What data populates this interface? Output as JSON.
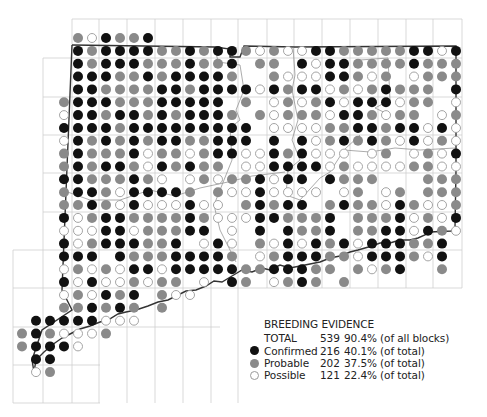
{
  "colors": {
    "confirmed": "#111111",
    "probable": "#8a8a8a",
    "possible_fill": "#ffffff",
    "possible_stroke": "#9a9a9a",
    "grid": "#cfcfcf",
    "border": "#333333"
  },
  "legend": {
    "title": "BREEDING EVIDENCE",
    "total": {
      "label": "TOTAL",
      "count": "539",
      "pct": "90.4% (of all blocks)"
    },
    "items": [
      {
        "key": "confirmed",
        "label": "Confirmed",
        "count": "216",
        "pct": "40.1% (of total)"
      },
      {
        "key": "probable",
        "label": "Probable",
        "count": "202",
        "pct": "37.5% (of total)"
      },
      {
        "key": "possible",
        "label": "Possible",
        "count": "121",
        "pct": "22.4% (of total)"
      }
    ]
  },
  "map": {
    "dot_grid": {
      "x0": 22,
      "dx": 14,
      "y0": 38,
      "dy": 12.85,
      "r": 5,
      "codes": {
        "B": "confirmed",
        "G": "probable",
        "O": "possible"
      },
      "rows": [
        "....GOBGGB......................",
        "....BGBBBBGGBGBBGOGOOBBGGGGGBBOB",
        "....BGBBBGGGBGGB.GG.BOBBGGGGBGGG",
        "....BBBGGBGBBBBG..GOOOBBGOG.OGGG",
        "....BBGGGGBBGBBBBOBGBBOGOGBGGG.B",
        "...GBBBGGGBBBBB.G.OGOGBOBBBOGG.O",
        "...OBBGBBGBGBBBG.GOGGGOBBGOGG.OG",
        "...BBBBGBBBBBBBBB.OOOOGGBBGBBOBO",
        "...OBGBGBGBBGGBBB.B.BOGBGBGOBOGO",
        "...GBGGGBOGGOGBBOOBGBOOO.OG.OGOB",
        "...GBGBBGOBGBGG.OOBBBBOGOOOOGGOO",
        "...BBGGGBGO.OGOGGBOBB.BGGG...GGG",
        "...GBBGOBBBBG.GOOBOOOO.OG.OG.GGG",
        "...GGBGOBOOOBOO.GBGBB.GBGGOBGOOG",
        "...BOGBBGGGGBGOOOBBGGGB.GGGBOGOB",
        "...OOOBBOGGGBB.O.B.BGGB.GGBBOBGO",
        "...BOGBBBGGB.OBO.GOBOBGBOBBBGGB.",
        "...BBB.BGGGBBBBG.OGBBBGGOBBBGOB.",
        "...OGOGOBBOBBBBBGGBBBGG.GOGB..G.",
        "...BOBOOGOGG.O.BG.OGBG.G........",
        "...OGOBGB.GOO...................",
        "...GGBGBG.G.....................",
        ".BBBBBOOO.......................",
        "GBGOOOG.........................",
        "GBBBO...........................",
        ".BB.............................",
        ".OG............................."
      ]
    },
    "grid": {
      "v_lines": [
        13,
        43,
        72,
        99,
        127,
        155,
        183,
        211,
        238,
        267,
        294,
        322,
        350,
        378,
        406,
        433,
        462
      ],
      "h_lines": [
        19,
        58,
        97,
        135,
        173,
        212,
        250,
        288,
        327,
        365,
        403
      ]
    }
  }
}
